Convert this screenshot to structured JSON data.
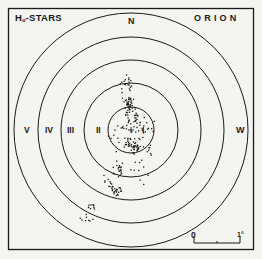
{
  "chart_data": {
    "type": "scatter",
    "title": "Hα-STARS",
    "title_parts": {
      "main": "H",
      "sub": "α",
      "rest": "-STARS"
    },
    "region": "ORION",
    "directions": {
      "north": "N",
      "west": "W"
    },
    "rings": [
      {
        "label": "I",
        "radius_px": 23
      },
      {
        "label": "II",
        "radius_px": 47
      },
      {
        "label": "III",
        "radius_px": 70
      },
      {
        "label": "IV",
        "radius_px": 93
      },
      {
        "label": "V",
        "radius_px": 117
      }
    ],
    "center_px": [
      131,
      130
    ],
    "center_mark": "+",
    "scale_bar": {
      "start_label": "0",
      "end_label": "1°",
      "length_px": 46
    },
    "points_description": "Clustered Hα emission stars concentrated in rings I–II, elongated north–south, with a trailing arm toward the south-east (lower-left) reaching ring IV.",
    "xlabel": "",
    "ylabel": "",
    "grid": false,
    "legend": "none"
  },
  "colors": {
    "ink": "#1a1a1a",
    "paper": "#f4f4f1"
  }
}
